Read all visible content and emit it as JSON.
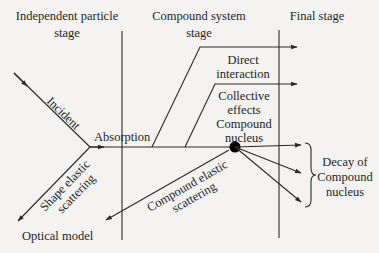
{
  "diagram": {
    "type": "nuclear-reaction-stages",
    "stages": [
      {
        "lines": [
          "Independent particle",
          "stage"
        ]
      },
      {
        "lines": [
          "Compound system",
          "stage"
        ]
      },
      {
        "lines": [
          "Final stage"
        ]
      }
    ],
    "labels": {
      "incident": "Incident",
      "absorption": "Absorption",
      "direct": [
        "Direct",
        "interaction"
      ],
      "collective": [
        "Collective",
        "effects",
        "Compound",
        "nucleus"
      ],
      "shape_elastic": [
        "Shape elastic",
        "scattering"
      ],
      "compound_elastic": [
        "Compound elastic",
        "scattering"
      ],
      "optical_model": "Optical model",
      "decay": [
        "Decay of",
        "Compound",
        "nucleus"
      ]
    },
    "colors": {
      "background": "#f4f3f1",
      "line": "#2a2a2a",
      "node": "#000000"
    }
  }
}
